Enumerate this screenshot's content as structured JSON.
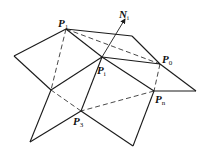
{
  "diagram": {
    "type": "polygon-mesh-vertex-normal",
    "labels": {
      "p1": {
        "main": "P",
        "sub": "1"
      },
      "ni": {
        "main": "N",
        "sub": "i"
      },
      "pi": {
        "main": "P",
        "sub": "i"
      },
      "p0": {
        "main": "P",
        "sub": "0"
      },
      "pn": {
        "main": "P",
        "sub": "n"
      },
      "p3": {
        "main": "P",
        "sub": "3"
      }
    },
    "vertices": {
      "P1": [
        66,
        29
      ],
      "Pi": [
        102,
        57
      ],
      "P0": [
        160,
        64
      ],
      "Pn": [
        154,
        91
      ],
      "P3": [
        81,
        111
      ],
      "left": [
        14,
        56
      ],
      "top_right": [
        132,
        36
      ],
      "right": [
        196,
        91
      ],
      "left_mid": [
        51,
        90
      ],
      "bottom_left": [
        30,
        142
      ],
      "bottom_right": [
        133,
        146
      ],
      "normal_tip": [
        125,
        20
      ]
    },
    "colors": {
      "stroke": "#1a1a1a",
      "background": "#ffffff"
    }
  }
}
